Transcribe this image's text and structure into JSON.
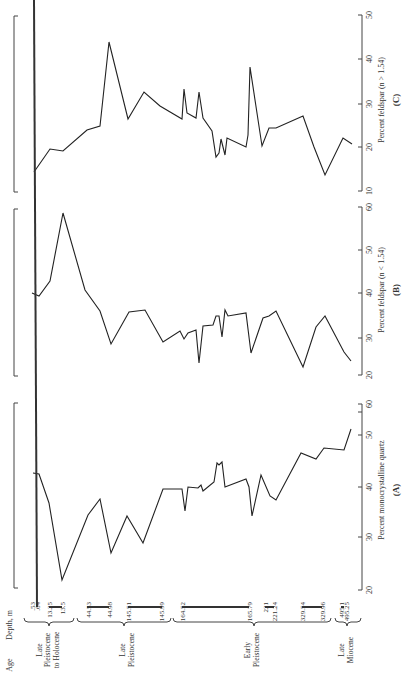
{
  "figure": {
    "orientation": "rotated-90-ccw",
    "panels": [
      {
        "id": "A",
        "label": "(A)",
        "axis_title": "Percent monocrystalline quartz",
        "ticks": [
          "20",
          "30",
          "40",
          "50",
          "60"
        ]
      },
      {
        "id": "B",
        "label": "(B)",
        "axis_title": "Percent feldspar  (n < 1.54)",
        "ticks": [
          "20",
          "30",
          "40",
          "50",
          "60"
        ]
      },
      {
        "id": "C",
        "label": "(C)",
        "axis_title": "Percent  feldspar (n > 1.54)",
        "ticks": [
          "10",
          "20",
          "30",
          "40",
          "50"
        ]
      }
    ],
    "depth_header": "Depth, m",
    "age_header": "Age",
    "depths": [
      ".53",
      ".64",
      "13.25",
      "13.5",
      "44.53",
      "44.98",
      "145.51",
      "145.99",
      "164.52",
      "165.79",
      "221",
      "221.24",
      "329.54",
      "329.96",
      "495.1",
      "495.25"
    ],
    "ages": [
      {
        "label": "Late Pleistocene to Holocene",
        "lines": [
          "Late",
          "Pleistocene",
          "to Holocene"
        ]
      },
      {
        "label": "Late Pleistocene",
        "lines": [
          "Late",
          "Pleistocene"
        ]
      },
      {
        "label": "Early Pleistocene",
        "lines": [
          "Early",
          "Pleistocene"
        ]
      },
      {
        "label": "Late Miocene",
        "lines": [
          "Late",
          "Miocene"
        ]
      }
    ]
  },
  "chart_data": [
    {
      "type": "line",
      "title": "(A)",
      "xlabel": "Depth, m (core interval order)",
      "ylabel": "Percent monocrystalline quartz",
      "ylim": [
        20,
        60
      ],
      "y": [
        43.5,
        43.3,
        37.5,
        20.5,
        34.5,
        37.8,
        25.5,
        35.5,
        28.8,
        40,
        40,
        34.8,
        40.2,
        40,
        40.8,
        39,
        41,
        45.2,
        44.5,
        45.2,
        40.5,
        42.5,
        40.8,
        33.5,
        42.8,
        38,
        37.2,
        47.3,
        46.2,
        48.5,
        48,
        52.5
      ]
    },
    {
      "type": "line",
      "title": "(B)",
      "xlabel": "Depth, m (core interval order)",
      "ylabel": "Percent feldspar (n < 1.54)",
      "ylim": [
        20,
        60
      ],
      "y": [
        40.5,
        39.8,
        43,
        58.8,
        41.2,
        36.2,
        29,
        36,
        36.3,
        29.6,
        31.8,
        30.2,
        31,
        31.8,
        24.3,
        32.8,
        33,
        35.3,
        35.3,
        30.8,
        36.5,
        35,
        35.5,
        26.5,
        34.5,
        36,
        23.3,
        32.8,
        35.3,
        27,
        24.8
      ]
    },
    {
      "type": "line",
      "title": "(C)",
      "xlabel": "Depth, m (core interval order)",
      "ylabel": "Percent feldspar (n > 1.54)",
      "ylim": [
        10,
        50
      ],
      "y": [
        14.5,
        19.8,
        19.3,
        24,
        24.8,
        44,
        26.3,
        32.5,
        29.5,
        26.3,
        33.3,
        28,
        26.5,
        32.5,
        26.3,
        24,
        17.5,
        22,
        18,
        22,
        20.3,
        22.5,
        38.3,
        20.3,
        24.5,
        24.5,
        27.3,
        19.5,
        14,
        22,
        20.5
      ]
    }
  ]
}
